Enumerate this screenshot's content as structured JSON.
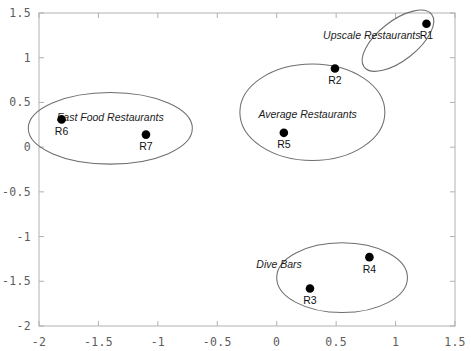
{
  "chart_data": {
    "type": "scatter",
    "title": "",
    "xlabel": "",
    "ylabel": "",
    "xlim": [
      -2,
      1.5
    ],
    "ylim": [
      -2,
      1.5
    ],
    "grid": false,
    "legend_position": "none",
    "xticks": [
      "-2",
      "-1.5",
      "-1",
      "-0.5",
      "0",
      "0.5",
      "1",
      "1.5"
    ],
    "xtick_values": [
      -2,
      -1.5,
      -1,
      -0.5,
      0,
      0.5,
      1,
      1.5
    ],
    "yticks": [
      "1.5",
      "1",
      "0.5",
      "0",
      "-0.5",
      "-1",
      "-1.5",
      "-2"
    ],
    "ytick_values": [
      1.5,
      1,
      0.5,
      0,
      -0.5,
      -1,
      -1.5,
      -2
    ],
    "points": [
      {
        "label": "R1",
        "x": 1.26,
        "y": 1.38
      },
      {
        "label": "R2",
        "x": 0.49,
        "y": 0.88
      },
      {
        "label": "R3",
        "x": 0.28,
        "y": -1.58
      },
      {
        "label": "R4",
        "x": 0.78,
        "y": -1.23
      },
      {
        "label": "R5",
        "x": 0.06,
        "y": 0.16
      },
      {
        "label": "R6",
        "x": -1.81,
        "y": 0.31
      },
      {
        "label": "R7",
        "x": -1.1,
        "y": 0.14
      }
    ],
    "annotations": [
      {
        "text": "Upscale Restaurants",
        "x": 0.8,
        "y": 1.25,
        "members": [
          "R1"
        ]
      },
      {
        "text": "Average Restaurants",
        "x": 0.26,
        "y": 0.37,
        "members": [
          "R2",
          "R5"
        ]
      },
      {
        "text": "Fast Food Restaurants",
        "x": -1.4,
        "y": 0.34,
        "members": [
          "R6",
          "R7"
        ]
      },
      {
        "text": "Dive Bars",
        "x": 0.02,
        "y": -1.31,
        "members": [
          "R3",
          "R4"
        ]
      }
    ],
    "clusters": [
      {
        "name": "Upscale Restaurants",
        "cx": 1.02,
        "cy": 1.19,
        "rx": 0.36,
        "ry": 0.22,
        "rotation": -38
      },
      {
        "name": "Average Restaurants",
        "cx": 0.3,
        "cy": 0.39,
        "rx": 0.61,
        "ry": 0.54,
        "rotation": 0
      },
      {
        "name": "Fast Food Restaurants",
        "cx": -1.4,
        "cy": 0.21,
        "rx": 0.69,
        "ry": 0.4,
        "rotation": 0
      },
      {
        "name": "Dive Bars",
        "cx": 0.55,
        "cy": -1.46,
        "rx": 0.55,
        "ry": 0.39,
        "rotation": 0
      }
    ],
    "marker_colors": {
      "point": "#000000",
      "ellipse": "#6e6e6e",
      "frame": "#b9b9b9"
    }
  }
}
